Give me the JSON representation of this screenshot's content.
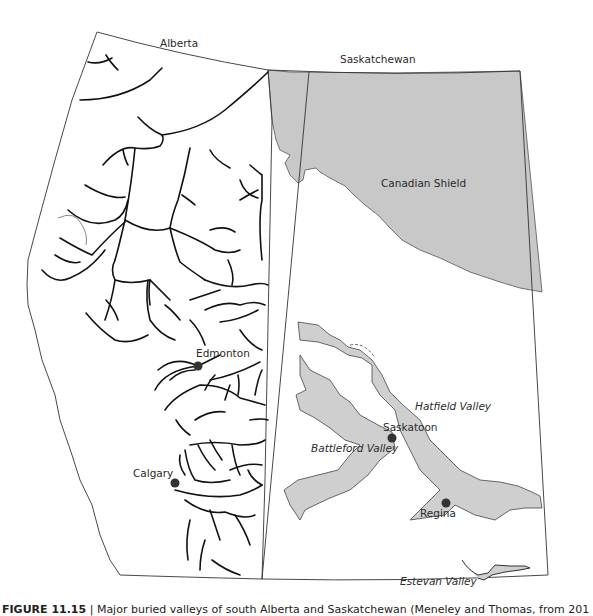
{
  "map": {
    "provinces": [
      {
        "name": "Alberta",
        "x": 160,
        "y": 47
      },
      {
        "name": "Saskatchewan",
        "x": 340,
        "y": 63
      }
    ],
    "regions": [
      {
        "name": "Canadian Shield",
        "x": 360,
        "y": 187,
        "fill": "#c8c8c8"
      }
    ],
    "cities": [
      {
        "name": "Edmonton",
        "label_x": 197,
        "label_y": 356,
        "dot_x": 198,
        "dot_y": 366
      },
      {
        "name": "Calgary",
        "label_x": 133,
        "label_y": 477,
        "dot_x": 175,
        "dot_y": 483
      },
      {
        "name": "Saskatoon",
        "label_x": 384,
        "label_y": 433,
        "dot_x": 392,
        "dot_y": 438
      },
      {
        "name": "Regina",
        "label_x": 420,
        "label_y": 517,
        "dot_x": 446,
        "dot_y": 503
      }
    ],
    "valleys": [
      {
        "name": "Hatfield Valley",
        "x": 414,
        "y": 410
      },
      {
        "name": "Battleford Valley",
        "x": 311,
        "y": 452
      },
      {
        "name": "Estevan Valley",
        "x": 400,
        "y": 585
      }
    ],
    "colors": {
      "river": "#111111",
      "boundary": "#333333",
      "buried_valley_fill": "#cfcfcf",
      "shield_fill": "#c8c8c8",
      "city_dot": "#333333"
    }
  },
  "caption": {
    "prefix": "FIGURE 11.15",
    "text": " | Major buried valleys of south Alberta and Saskatchewan (Meneley and Thomas, from 201"
  }
}
